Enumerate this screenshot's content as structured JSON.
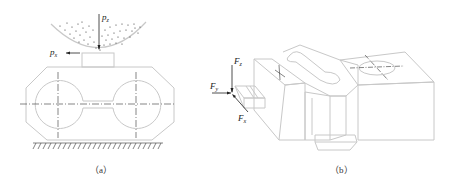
{
  "figure_a": {
    "caption": "（a）",
    "forces": [
      {
        "id": "pz",
        "symbol": "p",
        "subscript": "z",
        "direction": "down"
      },
      {
        "id": "px",
        "symbol": "p",
        "subscript": "x",
        "direction": "left"
      }
    ],
    "parts": [
      "grinding-wheel",
      "workpiece-block",
      "base-hatching"
    ]
  },
  "figure_b": {
    "caption": "（b）",
    "forces": [
      {
        "id": "fz",
        "symbol": "F",
        "subscript": "z",
        "direction": "down"
      },
      {
        "id": "fy",
        "symbol": "F",
        "subscript": "y",
        "direction": "right"
      },
      {
        "id": "fx",
        "symbol": "F",
        "subscript": "x",
        "direction": "diagonal-up-left"
      }
    ],
    "parts": [
      "cutting-tool",
      "workpiece-part"
    ]
  },
  "colors": {
    "line": "#c8c8c8",
    "dark": "#222222",
    "caption": "#333333"
  }
}
